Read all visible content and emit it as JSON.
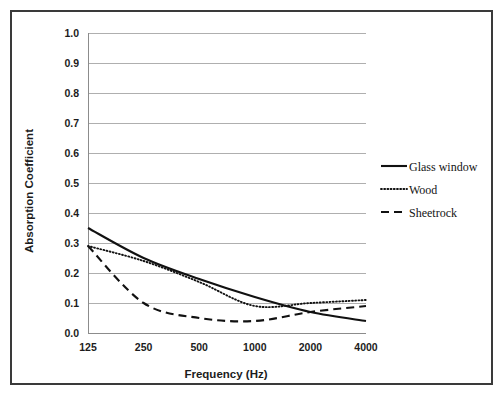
{
  "figure": {
    "background_color": "#ffffff",
    "border_color": "#3a3a3a",
    "gridline_color": "#a6a6a6",
    "line_color": "#111111"
  },
  "chart_data": {
    "type": "line",
    "title": "",
    "subtitle": "",
    "xlabel": "Frequency (Hz)",
    "ylabel": "Absorption Coefficient",
    "categories": [
      "125",
      "250",
      "500",
      "1000",
      "2000",
      "4000"
    ],
    "x": [
      125,
      250,
      500,
      1000,
      2000,
      4000
    ],
    "xscale": "log",
    "xlim": [
      125,
      4000
    ],
    "ylim": [
      0.0,
      1.0
    ],
    "ytick_labels": [
      "1.0",
      "0.9",
      "0.8",
      "0.7",
      "0.6",
      "0.5",
      "0.4",
      "0.3",
      "0.2",
      "0.1",
      "0.0"
    ],
    "ytick_values": [
      1.0,
      0.9,
      0.8,
      0.7,
      0.6,
      0.5,
      0.4,
      0.3,
      0.2,
      0.1,
      0.0
    ],
    "grid": "horizontal",
    "legend_position": "right",
    "series": [
      {
        "name": "Glass window",
        "style": "solid",
        "values": [
          0.35,
          0.25,
          0.18,
          0.12,
          0.07,
          0.04
        ]
      },
      {
        "name": "Wood",
        "style": "dotted",
        "values": [
          0.29,
          0.24,
          0.17,
          0.09,
          0.1,
          0.11
        ]
      },
      {
        "name": "Sheetrock",
        "style": "dashed",
        "values": [
          0.29,
          0.1,
          0.05,
          0.04,
          0.07,
          0.09
        ]
      }
    ]
  },
  "legend": {
    "items": [
      {
        "label": "Glass window",
        "style": "solid"
      },
      {
        "label": "Wood",
        "style": "dotted"
      },
      {
        "label": "Sheetrock",
        "style": "dashed"
      }
    ]
  },
  "axes": {
    "y_title": "Absorption Coefficient",
    "x_title": "Frequency (Hz)"
  }
}
